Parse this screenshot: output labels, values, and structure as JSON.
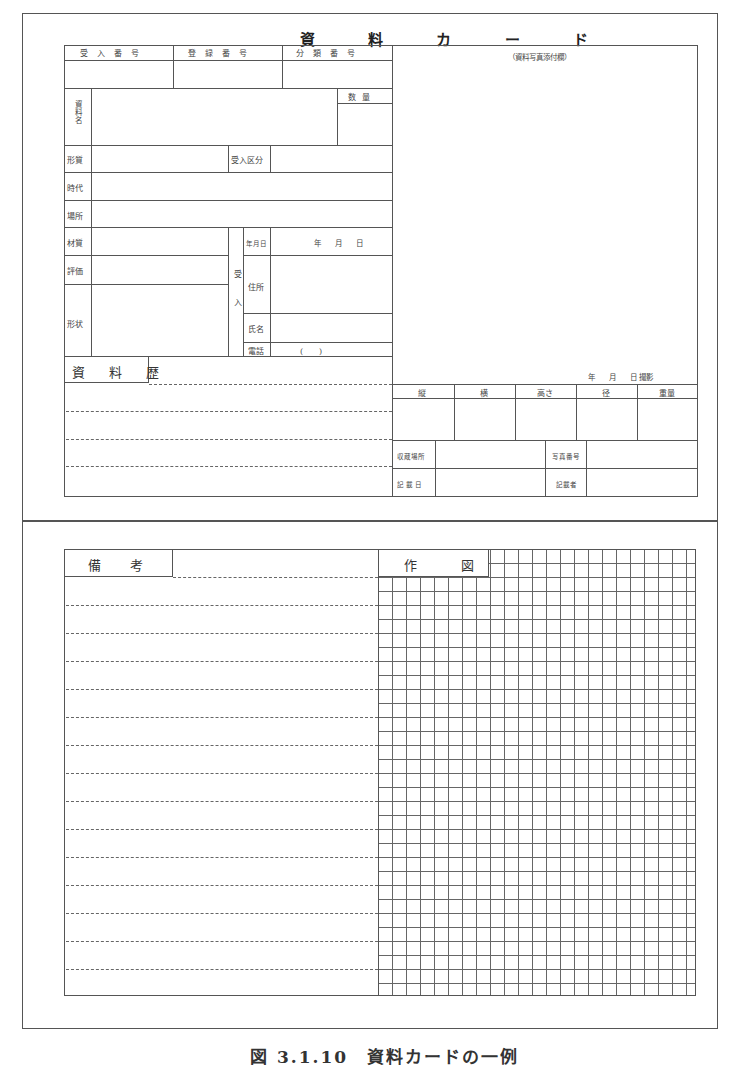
{
  "card": {
    "title": "資 料 カ ー ド",
    "header": {
      "accession_number": "受入番号",
      "registration_number": "登録番号",
      "classification_number": "分類番号"
    },
    "material_name": "資料名",
    "quantity": "数量",
    "fields": {
      "form_quality": "形質",
      "acceptance_category": "受入区分",
      "period": "時代",
      "place": "場所",
      "material": "材質",
      "evaluation": "評価",
      "shape": "形状"
    },
    "acceptance": {
      "group_label": "受入",
      "date_label": "年月日",
      "date_value": "年　　月　　日",
      "address": "住所",
      "name": "氏名",
      "phone": "電話",
      "phone_value": "(　　)"
    },
    "history": {
      "label": "資 料 歴",
      "lines": 4
    },
    "photo": {
      "label": "（資料写真添付欄）",
      "shot_date": "年　　月　　日 撮影"
    },
    "dimensions": {
      "headers": [
        "縦",
        "横",
        "高さ",
        "径",
        "重量"
      ]
    },
    "storage": {
      "storage_place": "収蔵場所",
      "photo_number": "写真番号",
      "entry_date": "記載日",
      "recorder": "記載者"
    }
  },
  "notes_section": {
    "remarks_label": "備　考",
    "drawing_label": "作　　図",
    "grid_columns": 23,
    "grid_rows": 32
  },
  "caption": "図 3.1.10　資料カードの一例"
}
